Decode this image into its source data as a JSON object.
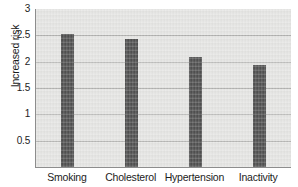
{
  "chart_data": {
    "type": "bar",
    "title": "",
    "xlabel": "",
    "ylabel": "Increased risk",
    "categories": [
      "Smoking",
      "Cholesterol",
      "Hypertension",
      "Inactivity"
    ],
    "values": [
      2.52,
      2.44,
      2.09,
      1.94
    ],
    "ylim": [
      0,
      3
    ],
    "yticks": [
      3,
      2.5,
      2,
      1.5,
      1,
      0.5
    ],
    "ytick_labels": [
      "3",
      "2.5",
      "2",
      "1.5",
      "1",
      "0.5"
    ],
    "grid": true,
    "legend": "none",
    "series": [
      {
        "name": "Increased risk",
        "values": [
          2.52,
          2.44,
          2.09,
          1.94
        ]
      }
    ]
  },
  "style": {
    "bar_color": "#4b4b4b",
    "plot_background": "#e4e4e2",
    "gridline_color": "#b0b0ae",
    "axis_color": "#8d8d8d",
    "text_color": "#1c1c1c",
    "page_background": "#ffffff"
  }
}
